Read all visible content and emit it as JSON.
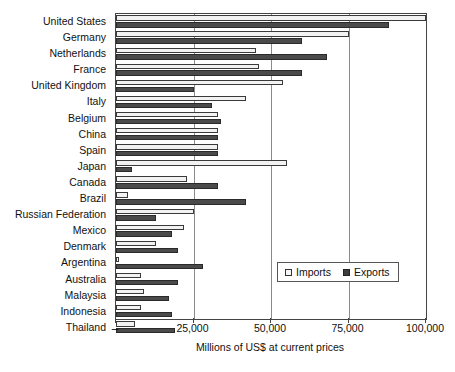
{
  "chart_data": {
    "type": "bar",
    "orientation": "horizontal",
    "title": "",
    "xlabel": "Millions of US$ at current prices",
    "ylabel": "",
    "xlim": [
      0,
      100000
    ],
    "grid": true,
    "legend_position": "inside-bottom-right",
    "xticks": [
      0,
      25000,
      50000,
      75000,
      100000
    ],
    "xticklabels": [
      "–",
      "25,000",
      "50,000",
      "75,000",
      "100,000"
    ],
    "categories": [
      "United States",
      "Germany",
      "Netherlands",
      "France",
      "United Kingdom",
      "Italy",
      "Belgium",
      "China",
      "Spain",
      "Japan",
      "Canada",
      "Brazil",
      "Russian Federation",
      "Mexico",
      "Denmark",
      "Argentina",
      "Australia",
      "Malaysia",
      "Indonesia",
      "Thailand"
    ],
    "series": [
      {
        "name": "Imports",
        "color": "#f2f2f2",
        "values": [
          100000,
          75000,
          45000,
          46000,
          54000,
          42000,
          33000,
          33000,
          33000,
          55000,
          23000,
          4000,
          25000,
          22000,
          13000,
          1000,
          8000,
          9000,
          8000,
          6000
        ]
      },
      {
        "name": "Exports",
        "color": "#4a4a4a",
        "values": [
          88000,
          60000,
          68000,
          60000,
          25000,
          31000,
          34000,
          33000,
          33000,
          5000,
          33000,
          42000,
          13000,
          18000,
          20000,
          28000,
          20000,
          17000,
          18000,
          19000
        ]
      }
    ]
  },
  "legend": {
    "items": [
      {
        "label": "Imports",
        "key": "imports"
      },
      {
        "label": "Exports",
        "key": "exports"
      }
    ]
  }
}
